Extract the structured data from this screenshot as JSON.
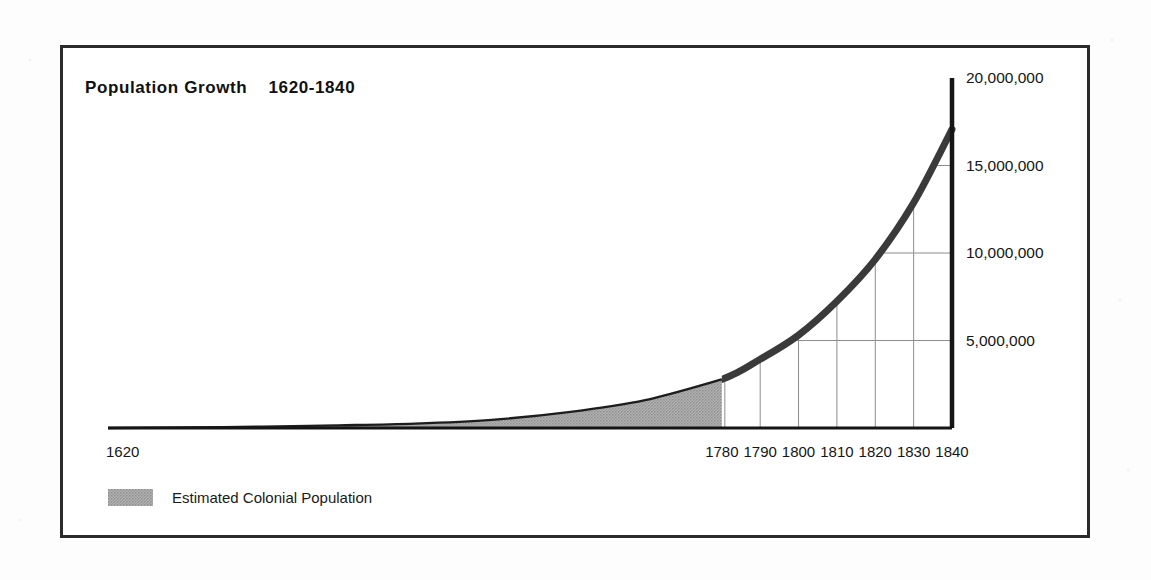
{
  "figure": {
    "title": "Population Growth    1620-1840",
    "frame_color": "#2b2b2b",
    "background": "#ffffff"
  },
  "legend": {
    "position": "bottom-left",
    "entries": [
      {
        "label": "Estimated Colonial Population",
        "swatch_color": "#a9a9a9",
        "pattern": "halftone"
      }
    ]
  },
  "chart_data": {
    "type": "area",
    "title": "Population Growth    1620-1840",
    "xlabel": "",
    "ylabel": "",
    "xlim": [
      1620,
      1840
    ],
    "ylim": [
      0,
      20000000
    ],
    "grid": true,
    "legend_position": "bottom-left",
    "x_tick_labels": [
      "1620",
      "1780",
      "1790",
      "1800",
      "1810",
      "1820",
      "1830",
      "1840"
    ],
    "x_tick_values": [
      1620,
      1780,
      1790,
      1800,
      1810,
      1820,
      1830,
      1840
    ],
    "y_tick_labels": [
      "5,000,000",
      "10,000,000",
      "15,000,000",
      "20,000,000"
    ],
    "y_tick_values": [
      5000000,
      10000000,
      15000000,
      20000000
    ],
    "series": [
      {
        "name": "Estimated Colonial Population",
        "style": "filled-area",
        "color": "#a9a9a9",
        "x": [
          1620,
          1650,
          1680,
          1700,
          1720,
          1740,
          1760,
          1780
        ],
        "values": [
          2000,
          50000,
          152000,
          250000,
          466000,
          905000,
          1594000,
          2780000
        ]
      },
      {
        "name": "United States Population",
        "style": "thick-line",
        "color": "#3a3a3a",
        "x": [
          1780,
          1790,
          1800,
          1810,
          1820,
          1830,
          1840
        ],
        "values": [
          2780000,
          3929000,
          5308000,
          7240000,
          9638000,
          12866000,
          17069000
        ]
      }
    ],
    "annotations": [
      {
        "text": "vertical gridlines drop from curve to baseline at each decade 1790-1840"
      },
      {
        "text": "horizontal gridlines run from curve rightward to the value axis at 5M, 10M, 15M"
      }
    ]
  },
  "axes": {
    "y_axis_side": "right",
    "x_axis_side": "bottom"
  }
}
